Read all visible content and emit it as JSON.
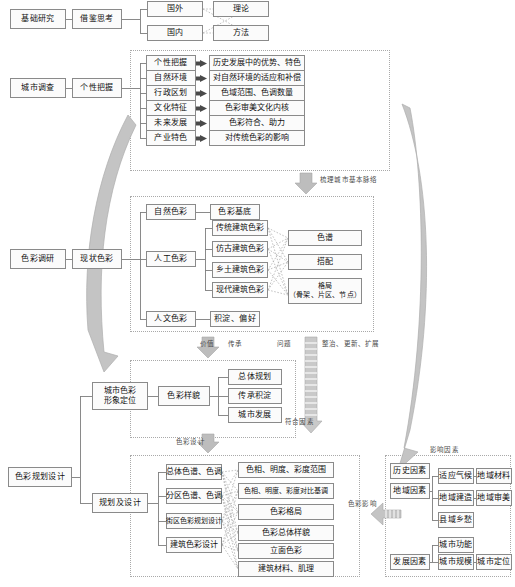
{
  "diagram": {
    "colors": {
      "box_border": "#8a8a8a",
      "box_fill": "#fbfbfb",
      "group_border": "#a9a9a9",
      "connector": "#7d7d7d",
      "dashed_connector": "#a8a8a8",
      "block_arrow_fill": "#bdbdbd",
      "curved_arrow_fill": "#c4c4c4",
      "text": "#111111",
      "caption_text": "#4b4b4b"
    }
  },
  "row_basic": {
    "root": "基础研究",
    "stage": "借鉴思考",
    "sources": [
      "国外",
      "国内"
    ],
    "outputs": [
      "理论",
      "方法"
    ]
  },
  "row_survey": {
    "root": "城市调查",
    "stage": "个性把握",
    "items": [
      {
        "key": "个性把握",
        "value": "历史发展中的优势、特色"
      },
      {
        "key": "自然环境",
        "value": "对自然环境的适应和补偿"
      },
      {
        "key": "行政区划",
        "value": "色域范围、色调数量"
      },
      {
        "key": "文化特征",
        "value": "色彩审美文化内核"
      },
      {
        "key": "未来发展",
        "value": "色彩符合、助力"
      },
      {
        "key": "产业特色",
        "value": "对传统色彩的影响"
      }
    ]
  },
  "row_research": {
    "root": "色彩调研",
    "stage": "现状色彩",
    "natural": {
      "key": "自然色彩",
      "value": "色彩基底"
    },
    "artificial": {
      "key": "人工色彩",
      "sources": [
        "传统建筑色彩",
        "仿古建筑色彩",
        "乡土建筑色彩",
        "现代建筑色彩"
      ],
      "targets": [
        "色谱",
        "搭配",
        "格局\n（骨架、片区、节点）"
      ],
      "targets_flat": [
        "色谱",
        "搭配",
        "格局（骨架、片区、节点）"
      ]
    },
    "humanistic": {
      "key": "人文色彩",
      "value": "积淀、偏好"
    }
  },
  "row_position": {
    "root": "色彩规划设计",
    "stage": "城市色彩\n形象定位",
    "stage_line1": "城市色彩",
    "stage_line2": "形象定位",
    "hub": "色彩样貌",
    "items": [
      "总体规划",
      "传承积淀",
      "城市发展"
    ],
    "note": "符合因素"
  },
  "row_design": {
    "stage": "规划及设计",
    "sources": [
      "总体色谱、色调",
      "分区色谱、色调",
      "街区色彩规划设计",
      "建筑色彩设计"
    ],
    "targets": [
      "色相、明度、彩度范围",
      "色相、明度、彩度对比基调",
      "色彩格局",
      "色彩总体样貌",
      "立面色彩",
      "建筑材料、肌理"
    ]
  },
  "row_factors": {
    "title": "影响因素",
    "history": "历史因素",
    "region": {
      "key": "地域因素",
      "items": [
        "适应气候",
        "地域建造",
        "县域乡愁"
      ],
      "sub": [
        "地域材料",
        "地域审美"
      ]
    },
    "development": {
      "key": "发展因素",
      "items": [
        "城市功能",
        "城市规模"
      ],
      "sub": [
        "城市定位"
      ]
    },
    "influence_label": "色彩影响"
  },
  "captions": {
    "survey_to_research": "梳理城市基本脉络",
    "value": "价值",
    "inherit": "传承",
    "problem": "问题",
    "renew": "整治、更新、扩展",
    "color_design": "色彩设计"
  }
}
